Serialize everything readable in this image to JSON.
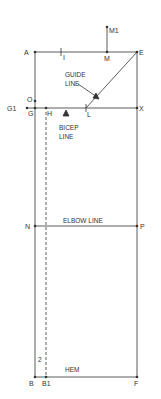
{
  "diagram": {
    "type": "sleeve pattern draft",
    "line_color": "#333333",
    "points": {
      "A": "A",
      "I": "I",
      "M": "M",
      "M1": "M1",
      "E": "E",
      "O": "O",
      "G1": "G1",
      "G": "G",
      "H": "H",
      "L": "L",
      "X": "X",
      "N": "N",
      "P": "P",
      "B": "B",
      "B1": "B1",
      "F": "F"
    },
    "labels": {
      "guide_line_1": "GUIDE",
      "guide_line_2": "LINE",
      "bicep_line_1": "BICEP",
      "bicep_line_2": "LINE",
      "elbow_line": "ELBOW LINE",
      "hem": "HEM",
      "measure_2": "2"
    }
  }
}
